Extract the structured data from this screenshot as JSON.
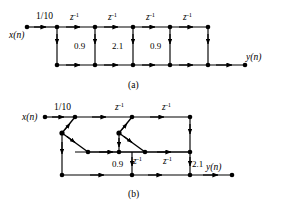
{
  "figure": {
    "background_color": "#ffffff",
    "line_color": "#000000",
    "node_color": "#000000",
    "captions": {
      "a": "(a)",
      "b": "(b)"
    },
    "signals": {
      "input": "x(n)",
      "output": "y(n)"
    },
    "labels": {
      "gain": "1/10",
      "delay_base": "z",
      "delay_exponent": "-1",
      "delay": "z⁻¹",
      "coef_09": "0.9",
      "coef_21": "2.1"
    }
  },
  "diagram_a": {
    "caption": "(a)",
    "input_label": "x(n)",
    "output_label": "y(n)",
    "gain_label": "1/10",
    "top_delays": [
      "z⁻¹",
      "z⁻¹",
      "z⁻¹",
      "z⁻¹"
    ],
    "vertical_coefficients": [
      "0.9",
      "2.1",
      "0.9"
    ],
    "top_nodes_x": [
      57,
      95,
      133,
      170,
      208
    ],
    "bottom_nodes_x": [
      57,
      95,
      133,
      170,
      208
    ],
    "top_y": 27,
    "bottom_y": 65,
    "input_node_x": 27,
    "output_node_x": 245,
    "delay_label_x": [
      76,
      114,
      152,
      189
    ],
    "delay_label_y": 20,
    "coef_label_x": [
      88,
      126,
      164
    ],
    "coef_label_y": 48,
    "structure": "cascade of four unit delays on top rail with three vertical coefficient branches feeding a bottom summation rail"
  },
  "diagram_b": {
    "caption": "(b)",
    "input_label": "x(n)",
    "output_label": "y(n)",
    "gain_label": "1/10",
    "top_delays": [
      "z⁻¹",
      "z⁻¹"
    ],
    "middle_delays": [
      "z⁻¹",
      "z⁻¹"
    ],
    "coefficients": [
      "0.9",
      "2.1"
    ],
    "top_y": 117,
    "mid_y": 152,
    "bottom_y": 175,
    "input_node_x": 45,
    "output_node_x": 232,
    "top_nodes_x": [
      75,
      132,
      190
    ],
    "mid_nodes_x": [
      75,
      132,
      190
    ],
    "bottom_nodes_x": [
      75,
      132,
      190
    ],
    "butterfly_apex_x": [
      62,
      119
    ],
    "butterfly_apex_y": 133,
    "structure": "two butterfly (cross-coupled) sections with delays on top and middle rails and a bottom summation rail"
  }
}
